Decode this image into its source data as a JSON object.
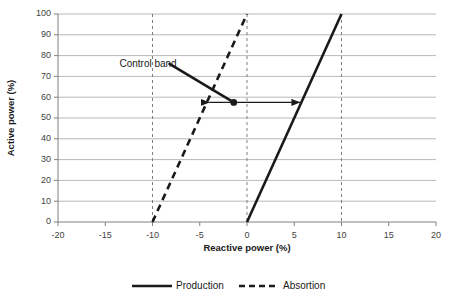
{
  "chart_data": {
    "type": "line",
    "title": "",
    "xlabel": "Reactive power (%)",
    "ylabel": "Active power (%)",
    "xlim": [
      -20,
      20
    ],
    "ylim": [
      0,
      100
    ],
    "xticks": [
      "-20",
      "-15",
      "-10",
      "-5",
      "0",
      "5",
      "10",
      "15",
      "20"
    ],
    "xtick_values": [
      -20,
      -15,
      -10,
      -5,
      0,
      5,
      10,
      15,
      20
    ],
    "yticks": [
      "0",
      "10",
      "20",
      "30",
      "40",
      "50",
      "60",
      "70",
      "80",
      "90",
      "100"
    ],
    "ytick_values": [
      0,
      10,
      20,
      30,
      40,
      50,
      60,
      70,
      80,
      90,
      100
    ],
    "grid": "horizontal",
    "legend_position": "bottom",
    "series": [
      {
        "name": "Production",
        "style": "solid",
        "color": "#1a1a1a",
        "x": [
          0,
          10
        ],
        "values": [
          0,
          100
        ]
      },
      {
        "name": "Absortion",
        "style": "dashed",
        "color": "#1a1a1a",
        "x": [
          -10,
          0
        ],
        "values": [
          0,
          100
        ]
      }
    ],
    "reference_lines": [
      {
        "name": "absorption-limit",
        "x": -10,
        "style": "dashed",
        "color": "#7f7f7f"
      },
      {
        "name": "zero-reactive",
        "x": 0,
        "style": "dashed",
        "color": "#7f7f7f"
      },
      {
        "name": "production-limit",
        "x": 10,
        "style": "dashed",
        "color": "#7f7f7f"
      }
    ],
    "annotations": [
      {
        "name": "control-band",
        "text": "Control band",
        "text_x": -13.5,
        "text_y": 76,
        "leader_from_x": -8.2,
        "leader_from_y": 76,
        "leader_to_x": -1.4,
        "leader_to_y": 57.5
      },
      {
        "name": "control-band-span",
        "type": "double-arrow",
        "x_start": -4.0,
        "x_end": 5.6,
        "y": 57.5,
        "marker_x": -1.4,
        "marker_y": 57.5
      }
    ]
  },
  "legend": {
    "items": [
      {
        "label": "Production",
        "style": "solid"
      },
      {
        "label": "Absortion",
        "style": "dashed"
      }
    ]
  },
  "colors": {
    "axis": "#808080",
    "grid": "#a6a6a6",
    "data": "#1a1a1a",
    "reference": "#808080",
    "text": "#262626",
    "background": "#ffffff"
  }
}
